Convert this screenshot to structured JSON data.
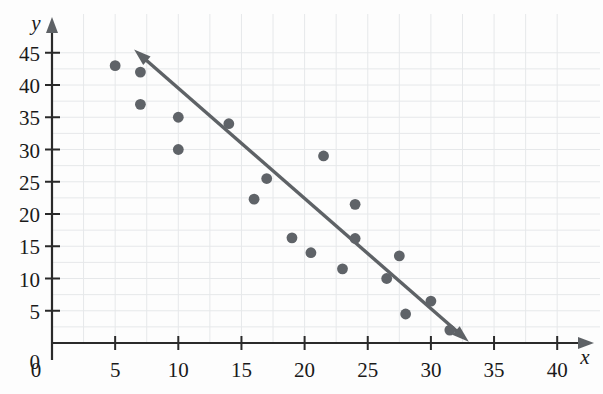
{
  "chart_data": {
    "type": "scatter",
    "title": "",
    "subtitle": "",
    "xlabel": "x",
    "ylabel": "y",
    "xlim": [
      0,
      42
    ],
    "ylim": [
      0,
      47
    ],
    "grid": true,
    "legend": "none",
    "x_ticks": [
      0,
      5,
      10,
      15,
      20,
      25,
      30,
      35,
      40
    ],
    "y_ticks": [
      0,
      5,
      10,
      15,
      20,
      25,
      30,
      35,
      40,
      45
    ],
    "x_tick_labels": [
      "0",
      "5",
      "10",
      "15",
      "20",
      "25",
      "30",
      "35",
      "40"
    ],
    "y_tick_labels": [
      "0",
      "5",
      "10",
      "15",
      "20",
      "25",
      "30",
      "35",
      "40",
      "45"
    ],
    "grid_step_x": 2.5,
    "grid_step_y": 2.5,
    "point_color": "#5f6368",
    "line_color": "#5e6266",
    "grid_color": "#e6e8ea",
    "axis_color": "#2a2a2a",
    "background_color": "#fdfdfd",
    "points": [
      {
        "x": 5.0,
        "y": 43.0
      },
      {
        "x": 7.0,
        "y": 42.0
      },
      {
        "x": 7.0,
        "y": 37.0
      },
      {
        "x": 10.0,
        "y": 35.0
      },
      {
        "x": 10.0,
        "y": 30.0
      },
      {
        "x": 14.0,
        "y": 34.0
      },
      {
        "x": 16.0,
        "y": 22.3
      },
      {
        "x": 17.0,
        "y": 25.5
      },
      {
        "x": 19.0,
        "y": 16.3
      },
      {
        "x": 20.5,
        "y": 14.0
      },
      {
        "x": 21.5,
        "y": 29.0
      },
      {
        "x": 23.0,
        "y": 11.5
      },
      {
        "x": 24.0,
        "y": 21.5
      },
      {
        "x": 24.0,
        "y": 16.2
      },
      {
        "x": 26.5,
        "y": 10.0
      },
      {
        "x": 27.5,
        "y": 13.5
      },
      {
        "x": 28.0,
        "y": 4.5
      },
      {
        "x": 30.0,
        "y": 6.5
      },
      {
        "x": 31.5,
        "y": 2.0
      }
    ],
    "trend_line": {
      "label": "line of best fit",
      "x_start": 6.5,
      "y_start": 45.5,
      "x_end": 33.0,
      "y_end": 0.2,
      "slope": -1.71,
      "intercept": 56.6,
      "arrow_start": true,
      "arrow_end": true
    },
    "annotations": []
  }
}
